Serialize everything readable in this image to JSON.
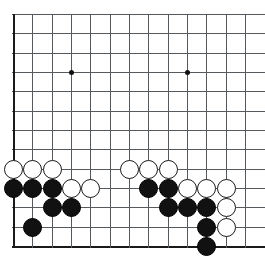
{
  "board": {
    "title": "Go board position",
    "description": "Go game board lower-left corner showing black and white stone groups",
    "colors": {
      "background": "#ffffff",
      "grid_line": "#555a5e",
      "border_line": "#1a1a1a",
      "black_stone": "#111111",
      "white_stone": "#ffffff",
      "white_stone_edge": "#1a1a1a"
    },
    "geometry": {
      "origin_x": 13,
      "origin_y": 14,
      "spacing": 19.33,
      "cols": 13,
      "rows": 13,
      "stone_diameter": 19,
      "star_diameter": 5,
      "left_edge_col": 0,
      "bottom_edge_row": 12
    },
    "star_points": [
      {
        "col": 3,
        "row": 3
      },
      {
        "col": 9,
        "row": 3
      }
    ],
    "stones": [
      {
        "col": 0,
        "row": 8,
        "color": "white"
      },
      {
        "col": 1,
        "row": 8,
        "color": "white"
      },
      {
        "col": 2,
        "row": 8,
        "color": "white"
      },
      {
        "col": 6,
        "row": 8,
        "color": "white"
      },
      {
        "col": 7,
        "row": 8,
        "color": "white"
      },
      {
        "col": 8,
        "row": 8,
        "color": "white"
      },
      {
        "col": 0,
        "row": 9,
        "color": "black"
      },
      {
        "col": 1,
        "row": 9,
        "color": "black"
      },
      {
        "col": 2,
        "row": 9,
        "color": "black"
      },
      {
        "col": 3,
        "row": 9,
        "color": "white"
      },
      {
        "col": 4,
        "row": 9,
        "color": "white"
      },
      {
        "col": 7,
        "row": 9,
        "color": "black"
      },
      {
        "col": 8,
        "row": 9,
        "color": "black"
      },
      {
        "col": 9,
        "row": 9,
        "color": "white"
      },
      {
        "col": 10,
        "row": 9,
        "color": "white"
      },
      {
        "col": 11,
        "row": 9,
        "color": "white"
      },
      {
        "col": 2,
        "row": 10,
        "color": "black"
      },
      {
        "col": 3,
        "row": 10,
        "color": "black"
      },
      {
        "col": 8,
        "row": 10,
        "color": "black"
      },
      {
        "col": 9,
        "row": 10,
        "color": "black"
      },
      {
        "col": 10,
        "row": 10,
        "color": "black"
      },
      {
        "col": 11,
        "row": 10,
        "color": "white"
      },
      {
        "col": 1,
        "row": 11,
        "color": "black"
      },
      {
        "col": 10,
        "row": 11,
        "color": "black"
      },
      {
        "col": 11,
        "row": 11,
        "color": "white"
      },
      {
        "col": 10,
        "row": 12,
        "color": "black"
      }
    ]
  }
}
